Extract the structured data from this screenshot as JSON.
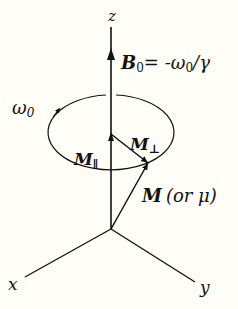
{
  "diagram": {
    "axes": {
      "z_label": "z",
      "x_label": "x",
      "y_label": "y"
    },
    "field": {
      "symbol": "B",
      "subscript": "0",
      "equation_rhs": "= -ω",
      "rhs_subscript": "0",
      "rhs_tail": "/γ"
    },
    "precession": {
      "label": "ω",
      "subscript": "0"
    },
    "components": {
      "parallel_label": "M",
      "parallel_sub": "∥",
      "perp_label": "M",
      "perp_sub": "⊥"
    },
    "vector": {
      "label": "M",
      "alt": "(or μ)"
    },
    "colors": {
      "ink": "#111111",
      "background": "#fffff7"
    }
  }
}
